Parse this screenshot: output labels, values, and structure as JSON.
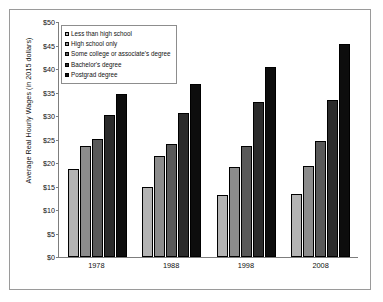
{
  "chart_data": {
    "type": "bar",
    "title": "",
    "xlabel": "",
    "ylabel": "Average Real Hourly Wages (in 2015 dollars)",
    "ylim": [
      0,
      50
    ],
    "ytick_step": 5,
    "grid": false,
    "legend_position": "top-left inside plot",
    "categories": [
      "1978",
      "1988",
      "1998",
      "2008"
    ],
    "yticks": [
      "$0",
      "$5",
      "$10",
      "$15",
      "$20",
      "$25",
      "$30",
      "$35",
      "$40",
      "$45",
      "$50"
    ],
    "ytick_values": [
      0,
      5,
      10,
      15,
      20,
      25,
      30,
      35,
      40,
      45,
      50
    ],
    "series": [
      {
        "name": "Less than high school",
        "color": "#b3b3b3",
        "values": [
          18.7,
          14.9,
          13.2,
          13.4
        ]
      },
      {
        "name": "High school only",
        "color": "#8c8c8c",
        "values": [
          23.6,
          21.4,
          19.1,
          19.3
        ]
      },
      {
        "name": "Some college or associate's degree",
        "color": "#595959",
        "values": [
          25.2,
          24.1,
          23.6,
          24.6
        ]
      },
      {
        "name": "Bachelor's degree",
        "color": "#2b2b2b",
        "values": [
          30.2,
          30.6,
          33.0,
          33.5
        ]
      },
      {
        "name": "Postgrad degree",
        "color": "#0d0d0d",
        "values": [
          34.6,
          36.9,
          40.5,
          45.3
        ]
      }
    ]
  }
}
